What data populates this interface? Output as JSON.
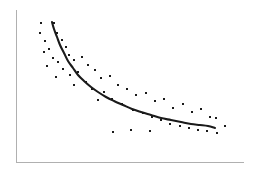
{
  "figure": {
    "width": 258,
    "height": 175,
    "background_color": "#ffffff",
    "title": "",
    "caption": ""
  },
  "axes": {
    "color": "#b0b0b0",
    "line_width": 1,
    "x_axis": {
      "name": "x-axis",
      "x1": 16,
      "y1": 162,
      "x2": 243,
      "y2": 162,
      "label": "",
      "ticks": [],
      "tick_labels": []
    },
    "y_axis": {
      "name": "y-axis",
      "x1": 16,
      "y1": 10,
      "x2": 16,
      "y2": 162,
      "label": "",
      "ticks": [],
      "tick_labels": []
    }
  },
  "chart_data": {
    "type": "scatter",
    "title": "",
    "subtitle": "",
    "xlabel": "",
    "ylabel": "",
    "xlim": [
      16,
      243
    ],
    "ylim": [
      10,
      162
    ],
    "grid": false,
    "legend": null,
    "legend_position": "none",
    "annotations": [],
    "axis_tick_labels_visible": false,
    "series": [
      {
        "name": "observations",
        "type": "scatter",
        "marker": "square",
        "marker_size": 2.6,
        "color": "#1a1a1a",
        "points": [
          [
            41,
            23
          ],
          [
            54,
            23
          ],
          [
            40,
            33
          ],
          [
            57,
            33
          ],
          [
            45,
            41
          ],
          [
            62,
            40
          ],
          [
            49,
            49
          ],
          [
            66,
            47
          ],
          [
            44,
            52
          ],
          [
            69,
            55
          ],
          [
            53,
            58
          ],
          [
            58,
            62
          ],
          [
            74,
            60
          ],
          [
            82,
            57
          ],
          [
            47,
            66
          ],
          [
            63,
            69
          ],
          [
            88,
            65
          ],
          [
            70,
            75
          ],
          [
            56,
            77
          ],
          [
            78,
            72
          ],
          [
            95,
            70
          ],
          [
            101,
            78
          ],
          [
            86,
            82
          ],
          [
            74,
            85
          ],
          [
            110,
            76
          ],
          [
            92,
            89
          ],
          [
            118,
            85
          ],
          [
            104,
            92
          ],
          [
            127,
            89
          ],
          [
            112,
            99
          ],
          [
            136,
            95
          ],
          [
            98,
            100
          ],
          [
            146,
            93
          ],
          [
            122,
            104
          ],
          [
            155,
            101
          ],
          [
            133,
            110
          ],
          [
            164,
            99
          ],
          [
            143,
            113
          ],
          [
            173,
            108
          ],
          [
            152,
            117
          ],
          [
            183,
            104
          ],
          [
            161,
            120
          ],
          [
            192,
            112
          ],
          [
            170,
            124
          ],
          [
            201,
            109
          ],
          [
            180,
            126
          ],
          [
            210,
            117
          ],
          [
            189,
            128
          ],
          [
            216,
            118
          ],
          [
            198,
            130
          ],
          [
            217,
            133
          ],
          [
            207,
            131
          ],
          [
            225,
            126
          ],
          [
            150,
            131
          ],
          [
            131,
            130
          ],
          [
            113,
            132
          ]
        ]
      },
      {
        "name": "fitted-decay-curve",
        "type": "line",
        "color": "#1a1a1a",
        "line_width": 2.1,
        "points": [
          [
            52,
            22
          ],
          [
            54,
            29
          ],
          [
            57,
            37
          ],
          [
            60,
            45
          ],
          [
            64,
            53
          ],
          [
            68,
            61
          ],
          [
            73,
            68
          ],
          [
            78,
            75
          ],
          [
            84,
            81
          ],
          [
            91,
            87
          ],
          [
            98,
            92
          ],
          [
            106,
            97
          ],
          [
            114,
            101
          ],
          [
            123,
            105
          ],
          [
            132,
            109
          ],
          [
            141,
            112
          ],
          [
            151,
            115
          ],
          [
            161,
            118
          ],
          [
            171,
            120
          ],
          [
            181,
            122
          ],
          [
            191,
            124
          ],
          [
            200,
            125
          ],
          [
            208,
            126
          ],
          [
            215,
            128
          ]
        ]
      }
    ]
  }
}
